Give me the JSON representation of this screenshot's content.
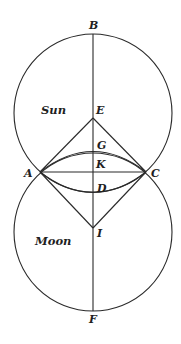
{
  "diagram": {
    "points": {
      "B": "B",
      "E": "E",
      "G": "G",
      "K": "K",
      "A": "A",
      "C": "C",
      "D": "D",
      "I": "I",
      "F": "F"
    },
    "bodies": {
      "sun": "Sun",
      "moon": "Moon"
    },
    "colors": {
      "stroke": "#2a2a2a",
      "background": "#ffffff"
    }
  }
}
